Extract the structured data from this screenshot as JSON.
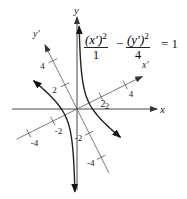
{
  "figure": {
    "type": "rotated-hyperbola",
    "equation": {
      "term1_numerator": "(x′)",
      "term1_exponent": "2",
      "term1_denominator": "1",
      "operator": "−",
      "term2_numerator": "(y′)",
      "term2_exponent": "2",
      "term2_denominator": "4",
      "equals": "= 1"
    },
    "hyperbola": {
      "a_squared": 1,
      "b_squared": 4,
      "rotation_degrees": 26.57
    },
    "axes": {
      "x_label": "x",
      "y_label": "y",
      "xprime_label": "x′",
      "yprime_label": "y′"
    },
    "x_ticks": [
      {
        "value": 2,
        "label": "2"
      }
    ],
    "xprime_ticks": [
      {
        "value": -4,
        "label": "-4"
      },
      {
        "value": -2,
        "label": "-2"
      },
      {
        "value": 2,
        "label": "2"
      },
      {
        "value": 4,
        "label": "4"
      }
    ],
    "yprime_ticks": [
      {
        "value": -4,
        "label": "-4"
      },
      {
        "value": -2,
        "label": "-2"
      },
      {
        "value": 2,
        "label": "2"
      },
      {
        "value": 4,
        "label": "4"
      }
    ],
    "colors": {
      "curve": "#222222",
      "axis": "#333333",
      "rotated_axis": "#555555"
    }
  }
}
